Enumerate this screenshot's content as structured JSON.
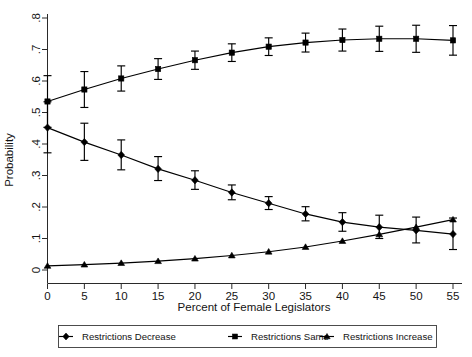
{
  "chart_data": {
    "type": "line",
    "title": "",
    "subtitle": "",
    "xlabel": "Percent of Female Legislators",
    "ylabel": "Probability",
    "x": [
      0,
      5,
      10,
      15,
      20,
      25,
      30,
      35,
      40,
      45,
      50,
      55
    ],
    "xtick_labels": [
      "0",
      "5",
      "10",
      "15",
      "20",
      "25",
      "30",
      "35",
      "40",
      "45",
      "50",
      "55"
    ],
    "ytick_labels": [
      "0",
      ".1",
      ".2",
      ".3",
      ".4",
      ".5",
      ".6",
      ".7",
      ".8"
    ],
    "ytick_values": [
      0,
      0.1,
      0.2,
      0.3,
      0.4,
      0.5,
      0.6,
      0.7,
      0.8
    ],
    "xlim": [
      -2,
      57
    ],
    "ylim": [
      0,
      0.8
    ],
    "grid": false,
    "legend_position": "bottom",
    "error_bars": true,
    "series": [
      {
        "name": "Restrictions Decrease",
        "marker": "diamond",
        "values": [
          0.452,
          0.406,
          0.365,
          0.321,
          0.285,
          0.246,
          0.212,
          0.178,
          0.152,
          0.136,
          0.126,
          0.114
        ],
        "err_low": [
          0.372,
          0.348,
          0.318,
          0.284,
          0.256,
          0.223,
          0.192,
          0.156,
          0.123,
          0.1,
          0.086,
          0.065
        ],
        "err_high": [
          0.534,
          0.466,
          0.413,
          0.36,
          0.315,
          0.27,
          0.233,
          0.201,
          0.182,
          0.174,
          0.168,
          0.165
        ]
      },
      {
        "name": "Restrictions Same",
        "marker": "square",
        "values": [
          0.535,
          0.573,
          0.608,
          0.638,
          0.666,
          0.69,
          0.709,
          0.722,
          0.73,
          0.734,
          0.734,
          0.729
        ],
        "err_low": [
          0.453,
          0.516,
          0.568,
          0.605,
          0.637,
          0.662,
          0.681,
          0.692,
          0.695,
          0.694,
          0.691,
          0.682
        ],
        "err_high": [
          0.617,
          0.63,
          0.648,
          0.671,
          0.695,
          0.718,
          0.737,
          0.752,
          0.765,
          0.774,
          0.777,
          0.776
        ]
      },
      {
        "name": "Restrictions Increase",
        "marker": "triangle",
        "values": [
          0.013,
          0.017,
          0.022,
          0.028,
          0.036,
          0.046,
          0.058,
          0.073,
          0.092,
          0.113,
          0.136,
          0.16
        ]
      }
    ]
  },
  "legend": {
    "items": [
      {
        "label": "Restrictions Decrease",
        "marker": "diamond"
      },
      {
        "label": "Restrictions Same",
        "marker": "square"
      },
      {
        "label": "Restrictions Increase",
        "marker": "triangle"
      }
    ]
  },
  "colors": {
    "line": "#000000",
    "axis": "#2a2a2a",
    "text": "#141414",
    "background": "#ffffff"
  }
}
